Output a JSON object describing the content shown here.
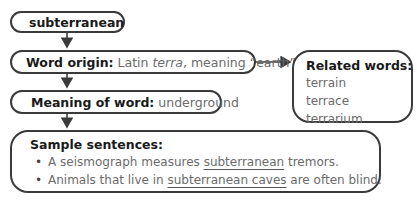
{
  "word_box": {
    "word": "subterranean"
  },
  "origin_box": {
    "label": "Word origin:",
    "text_prefix": "Latin ",
    "text_italic": "terra",
    "text_suffix": ", meaning “earth”"
  },
  "related_box": {
    "label": "Related words:",
    "words": [
      "terrain",
      "terrace",
      "terrarium"
    ]
  },
  "meaning_box": {
    "label": "Meaning of word:",
    "text": "underground"
  },
  "sentences_box": {
    "label": "Sample sentences:",
    "sentences": [
      {
        "before": "A seismograph measures ",
        "underlined": "subterranean",
        "after": " tremors."
      },
      {
        "before": "Animals that live in ",
        "underlined": "subterranean caves",
        "after": " are often blind."
      }
    ]
  },
  "colors": {
    "border": "#3a3a3a",
    "label": "#1a1a1a",
    "value": "#6b6b6b"
  }
}
